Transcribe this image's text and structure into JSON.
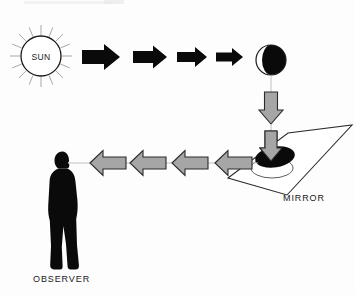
{
  "diagram": {
    "labels": {
      "sun": "SUN",
      "mirror": "MIRROR",
      "observer": "OBSERVER"
    },
    "colors": {
      "background": "#fdfdfd",
      "ink": "#1a1a1a",
      "sunlight_arrow": "#0a0a0a",
      "reflected_arrow_fill": "#a6a6a6",
      "reflected_arrow_stroke": "#2b2b2b",
      "ray": "#a8a8a8",
      "sight_line": "#b9b9b9",
      "moon_lit": "#ffffff",
      "moon_dark": "#0a0a0a",
      "mirror_face": "#ffffff",
      "mirror_spot": "#0a0a0a",
      "silhouette": "#0a0a0a"
    },
    "nodes": [
      {
        "id": "sun",
        "name": "sun",
        "label": "SUN",
        "shape": "rayed-circle",
        "cx": 41,
        "cy": 56,
        "r": 20,
        "ray_count": 16
      },
      {
        "id": "moon",
        "name": "moon",
        "label": "",
        "shape": "half-shaded-circle",
        "cx": 271,
        "cy": 60,
        "r": 15,
        "lit_side": "left",
        "dark_side": "right"
      },
      {
        "id": "mirror",
        "name": "mirror",
        "label": "MIRROR",
        "shape": "parallelogram",
        "label_x": 283,
        "label_y": 201
      },
      {
        "id": "observer",
        "name": "observer",
        "label": "OBSERVER",
        "shape": "human-silhouette",
        "facing": "right",
        "label_x": 33,
        "label_y": 282
      }
    ],
    "flows": [
      {
        "id": "sun-to-moon",
        "name": "sunlight-beam",
        "from": "sun",
        "to": "moon",
        "direction": "right",
        "style": "solid-black",
        "arrow_count": 4,
        "description": "Sunlight travels rightward from the Sun to the Moon"
      },
      {
        "id": "moon-to-mirror",
        "name": "moonlight-beam",
        "from": "moon",
        "to": "mirror",
        "direction": "down",
        "style": "gray-outlined",
        "arrow_count": 2,
        "description": "Reflected moonlight travels downward onto the mirror"
      },
      {
        "id": "mirror-to-observer",
        "name": "reflected-beam",
        "from": "mirror",
        "to": "observer",
        "direction": "left",
        "style": "gray-outlined",
        "arrow_count": 4,
        "description": "Light reflects off the mirror leftward into the observer's eye"
      }
    ]
  }
}
